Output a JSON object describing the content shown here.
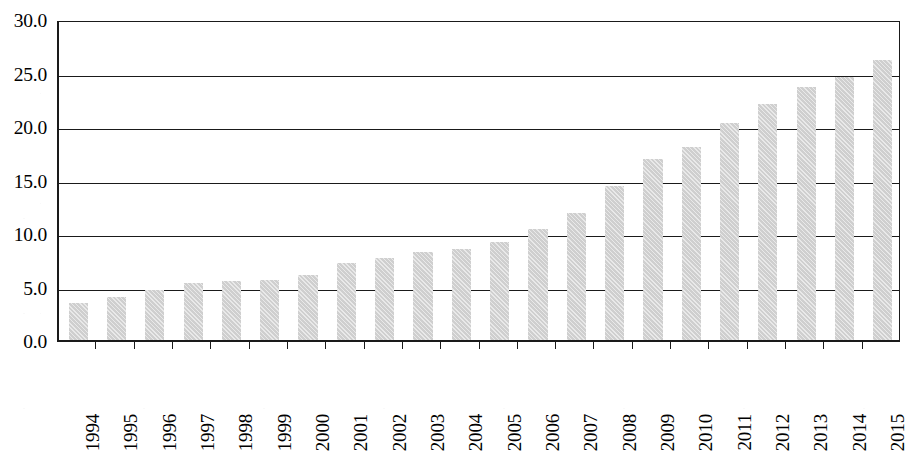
{
  "chart_data": {
    "type": "bar",
    "title": "",
    "subtitle": "",
    "xlabel": "",
    "ylabel": "",
    "categories": [
      "1994",
      "1995",
      "1996",
      "1997",
      "1998",
      "1999",
      "2000",
      "2001",
      "2002",
      "2003",
      "2004",
      "2005",
      "2006",
      "2007",
      "2008",
      "2009",
      "2010",
      "2011",
      "2012",
      "2013",
      "2014",
      "2015"
    ],
    "values": [
      3.5,
      4.0,
      4.7,
      5.3,
      5.5,
      5.6,
      6.1,
      7.2,
      7.7,
      8.2,
      8.5,
      9.2,
      10.4,
      11.9,
      14.4,
      16.9,
      18.0,
      20.3,
      22.1,
      23.6,
      24.6,
      26.2
    ],
    "series": [
      {
        "name": "",
        "values": [
          3.5,
          4.0,
          4.7,
          5.3,
          5.5,
          5.6,
          6.1,
          7.2,
          7.7,
          8.2,
          8.5,
          9.2,
          10.4,
          11.9,
          14.4,
          16.9,
          18.0,
          20.3,
          22.1,
          23.6,
          24.6,
          26.2
        ]
      }
    ],
    "ylim": [
      0,
      30
    ],
    "yticks": [
      0.0,
      5.0,
      10.0,
      15.0,
      20.0,
      25.0,
      30.0
    ],
    "ytick_labels": [
      "0.0",
      "5.0",
      "10.0",
      "15.0",
      "20.0",
      "25.0",
      "30.0"
    ],
    "xtick_labels": [
      "1994",
      "1995",
      "1996",
      "1997",
      "1998",
      "1999",
      "2000",
      "2001",
      "2002",
      "2003",
      "2004",
      "2005",
      "2006",
      "2007",
      "2008",
      "2009",
      "2010",
      "2011",
      "2012",
      "2013",
      "2014",
      "2015"
    ],
    "xtick_rotation": 90,
    "grid": "horizontal",
    "legend": "none",
    "annotations": [],
    "colors": {
      "bar_fill": "#cfcfcf",
      "axis": "#1a1a1a",
      "gridline": "#1a1a1a",
      "background": "#ffffff",
      "text": "#000000"
    }
  }
}
